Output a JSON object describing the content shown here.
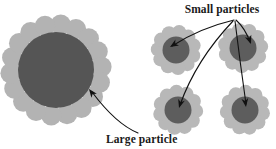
{
  "figure": {
    "background_color": "#ffffff",
    "width": 276,
    "height": 149
  },
  "colors": {
    "large_core": "#555555",
    "large_satellite": "#b3b3b3",
    "cluster_core": "#5d5d5d",
    "cluster_satellite": "#b8b8b8",
    "arrow": "#111111",
    "text": "#1a1a1a"
  },
  "labels": [
    {
      "id": "small-particles",
      "text": "Small particles",
      "x": 222,
      "y": 13,
      "anchor": "middle"
    },
    {
      "id": "large-particle",
      "text": "Large particle",
      "x": 106,
      "y": 143,
      "anchor": "start"
    }
  ],
  "large_particle": {
    "name": "large-particle-assembly",
    "cx": 56,
    "cy": 70,
    "core_radius": 38,
    "satellite_radius": 10.2,
    "ring_radius": 45.5,
    "satellite_count": 18,
    "start_angle_deg": -84
  },
  "clusters": [
    {
      "id": "cluster-top-left",
      "cx": 176,
      "cy": 50,
      "core_radius": 13.5,
      "satellite_radius": 7.2,
      "ring_radius": 18.0,
      "satellite_count": 11,
      "start_angle_deg": -80
    },
    {
      "id": "cluster-top-right",
      "cx": 243,
      "cy": 48,
      "core_radius": 13.5,
      "satellite_radius": 7.2,
      "ring_radius": 18.0,
      "satellite_count": 11,
      "start_angle_deg": -70
    },
    {
      "id": "cluster-bottom-left",
      "cx": 178,
      "cy": 110,
      "core_radius": 13.5,
      "satellite_radius": 7.2,
      "ring_radius": 18.0,
      "satellite_count": 11,
      "start_angle_deg": -95
    },
    {
      "id": "cluster-bottom-right",
      "cx": 245,
      "cy": 110,
      "core_radius": 13.5,
      "satellite_radius": 7.2,
      "ring_radius": 18.0,
      "satellite_count": 11,
      "start_angle_deg": -88
    }
  ],
  "arrows": [
    {
      "id": "arrow-to-cluster-top-left",
      "from_label": "small-particles",
      "to_target": "cluster-top-left",
      "path": "M 234 20 Q 200 28 172 46",
      "tip_x": 170,
      "tip_y": 47,
      "tip_angle_deg": 148
    },
    {
      "id": "arrow-to-cluster-top-right",
      "from_label": "small-particles",
      "to_target": "cluster-top-right",
      "path": "M 236 20 Q 245 28 250 42",
      "tip_x": 251,
      "tip_y": 44,
      "tip_angle_deg": 70
    },
    {
      "id": "arrow-to-cluster-bottom-left",
      "from_label": "small-particles",
      "to_target": "cluster-bottom-left",
      "path": "M 233 21 Q 196 60 180 105",
      "tip_x": 179,
      "tip_y": 108,
      "tip_angle_deg": 107
    },
    {
      "id": "arrow-to-cluster-bottom-right",
      "from_label": "small-particles",
      "to_target": "cluster-bottom-right",
      "path": "M 235 21 Q 240 62 246 104",
      "tip_x": 246,
      "tip_y": 107,
      "tip_angle_deg": 82
    },
    {
      "id": "arrow-to-large-particle",
      "from_label": "large-particle",
      "to_target": "large-particle-assembly",
      "path": "M 138 133 Q 116 124 92 92",
      "tip_x": 89,
      "tip_y": 89,
      "tip_angle_deg": 233
    }
  ]
}
